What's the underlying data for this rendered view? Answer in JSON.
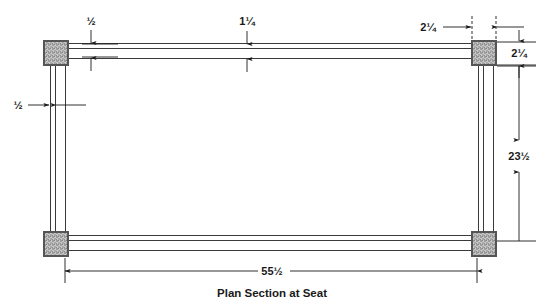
{
  "drawing": {
    "title": "Plan Section at Seat",
    "type": "technical-drawing",
    "units": "inches",
    "colors": {
      "line": "#3a3a3a",
      "dimension_line": "#1a1a1a",
      "post_fill": "#b9b9b9",
      "post_stroke": "#555555",
      "background": "#ffffff",
      "text": "#1a1a1a"
    },
    "dimensions": [
      {
        "id": "top-rail-thickness",
        "label": "½",
        "value": 0.5,
        "position": "top-left",
        "orientation": "vertical"
      },
      {
        "id": "mid-rail-width",
        "label": "1¼",
        "value": 1.25,
        "position": "top-center",
        "orientation": "vertical"
      },
      {
        "id": "post-width",
        "label": "2¼",
        "value": 2.25,
        "position": "top-right",
        "orientation": "horizontal"
      },
      {
        "id": "post-depth",
        "label": "2¼",
        "value": 2.25,
        "position": "right-top",
        "orientation": "vertical"
      },
      {
        "id": "side-rail-thickness",
        "label": "½",
        "value": 0.5,
        "position": "left-middle",
        "orientation": "horizontal"
      },
      {
        "id": "overall-depth",
        "label": "23½",
        "value": 23.5,
        "position": "right",
        "orientation": "vertical"
      },
      {
        "id": "overall-width",
        "label": "55½",
        "value": 55.5,
        "position": "bottom",
        "orientation": "horizontal"
      }
    ],
    "posts": [
      {
        "id": "post-top-left",
        "label": "corner post"
      },
      {
        "id": "post-top-right",
        "label": "corner post"
      },
      {
        "id": "post-bottom-left",
        "label": "corner post"
      },
      {
        "id": "post-bottom-right",
        "label": "corner post"
      }
    ],
    "rails": [
      {
        "id": "rail-top",
        "label": "top rail"
      },
      {
        "id": "rail-bottom",
        "label": "bottom rail"
      },
      {
        "id": "rail-left",
        "label": "left rail"
      },
      {
        "id": "rail-right",
        "label": "right rail"
      }
    ]
  }
}
